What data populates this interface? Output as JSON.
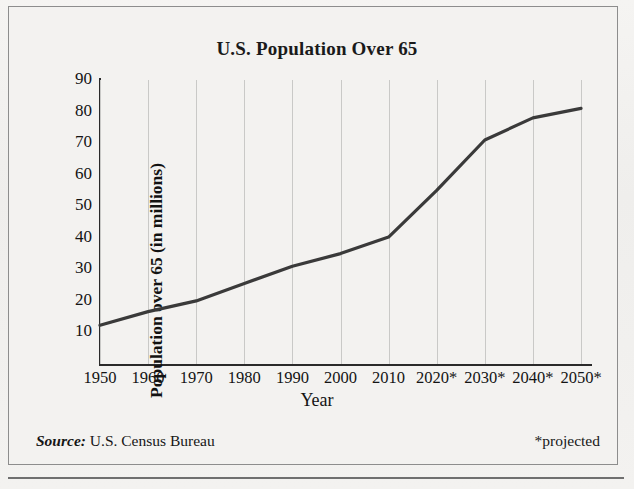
{
  "figure": {
    "title": "U.S. Population Over 65",
    "source_label": "Source:",
    "source_text": "U.S. Census Bureau",
    "projected_note": "*projected"
  },
  "chart_data": {
    "type": "line",
    "title": "U.S. Population Over 65",
    "xlabel": "Year",
    "ylabel": "Population over 65 (in millions)",
    "categories": [
      "1950",
      "1960",
      "1970",
      "1980",
      "1990",
      "2000",
      "2010",
      "2020*",
      "2030*",
      "2040*",
      "2050*"
    ],
    "x": [
      1950,
      1960,
      1970,
      1980,
      1990,
      2000,
      2010,
      2020,
      2030,
      2040,
      2050
    ],
    "values": [
      12.3,
      16.6,
      20.0,
      25.5,
      31.0,
      35.0,
      40.2,
      55.0,
      71.0,
      78.0,
      81.0
    ],
    "ytick_labels": [
      "10",
      "20",
      "30",
      "40",
      "50",
      "60",
      "70",
      "80",
      "90"
    ],
    "yticks": [
      10,
      20,
      30,
      40,
      50,
      60,
      70,
      80,
      90
    ],
    "ylim": [
      0,
      90
    ],
    "xlim": [
      1950,
      2050
    ],
    "grid": "vertical",
    "legend": "none",
    "series_color": "#3a3a3a",
    "annotations": [
      "*projected"
    ]
  }
}
